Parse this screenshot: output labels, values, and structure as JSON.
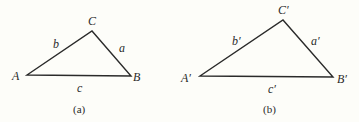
{
  "figures": [
    {
      "caption": "(a)",
      "vertices": {
        "A": {
          "label": "A",
          "x": 27,
          "y": 75
        },
        "B": {
          "label": "B",
          "x": 131,
          "y": 76
        },
        "C": {
          "label": "C",
          "x": 92,
          "y": 31
        }
      },
      "sides": {
        "a": "a",
        "b": "b",
        "c": "c"
      }
    },
    {
      "caption": "(b)",
      "vertices": {
        "A": {
          "label": "A′",
          "x": 200,
          "y": 76
        },
        "B": {
          "label": "B′",
          "x": 333,
          "y": 77
        },
        "C": {
          "label": "C′",
          "x": 283,
          "y": 20
        }
      },
      "sides": {
        "a": "a′",
        "b": "b′",
        "c": "c′"
      }
    }
  ]
}
